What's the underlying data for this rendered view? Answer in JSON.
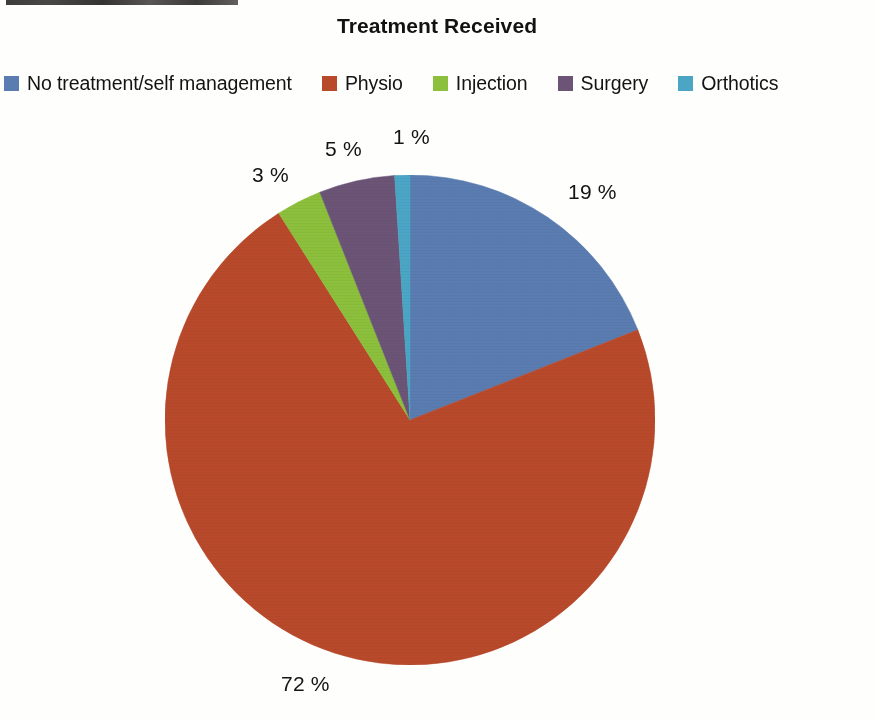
{
  "figure": {
    "title": "Treatment Received",
    "background_color": "#fefefd"
  },
  "legend": {
    "position": "top",
    "items": [
      {
        "label": "No treatment/self management",
        "color": "#5a7cb0",
        "swatch_name": "legend-swatch-no-treatment"
      },
      {
        "label": "Physio",
        "color": "#b8492b",
        "swatch_name": "legend-swatch-physio"
      },
      {
        "label": "Injection",
        "color": "#8cc03c",
        "swatch_name": "legend-swatch-injection"
      },
      {
        "label": "Surgery",
        "color": "#6b5476",
        "swatch_name": "legend-swatch-surgery"
      },
      {
        "label": "Orthotics",
        "color": "#4aa6c4",
        "swatch_name": "legend-swatch-orthotics"
      }
    ]
  },
  "labels": {
    "no_treatment": "19 %",
    "physio": "72 %",
    "injection": "3 %",
    "surgery": "5 %",
    "orthotics": "1 %"
  },
  "chart_data": {
    "type": "pie",
    "title": "Treatment Received",
    "xlabel": "",
    "ylabel": "",
    "units": "percent",
    "total": 100,
    "start_angle_deg": 0,
    "direction": "clockwise",
    "legend_position": "top",
    "grid": false,
    "categories": [
      "No treatment/self management",
      "Physio",
      "Injection",
      "Surgery",
      "Orthotics"
    ],
    "values": [
      19,
      72,
      3,
      5,
      1
    ],
    "value_labels": [
      "19 %",
      "72 %",
      "3 %",
      "5 %",
      "1 %"
    ],
    "colors": [
      "#5a7cb0",
      "#b8492b",
      "#8cc03c",
      "#6b5476",
      "#4aa6c4"
    ],
    "slices": [
      {
        "name": "No treatment/self management",
        "value": 19,
        "label": "19 %",
        "color": "#5a7cb0"
      },
      {
        "name": "Physio",
        "value": 72,
        "label": "72 %",
        "color": "#b8492b"
      },
      {
        "name": "Injection",
        "value": 3,
        "label": "3 %",
        "color": "#8cc03c"
      },
      {
        "name": "Surgery",
        "value": 5,
        "label": "5 %",
        "color": "#6b5476"
      },
      {
        "name": "Orthotics",
        "value": 1,
        "label": "1 %",
        "color": "#4aa6c4"
      }
    ]
  }
}
